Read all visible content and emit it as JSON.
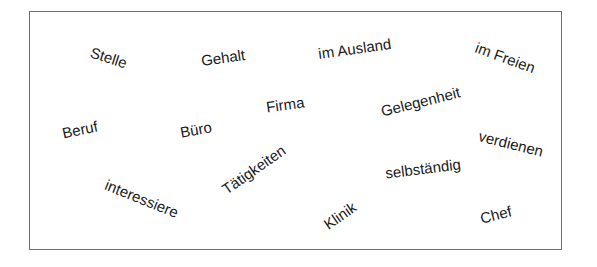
{
  "word_box": {
    "border_color": "#6e6e6e",
    "words": [
      {
        "text": "Stelle",
        "cx": 109,
        "cy": 57,
        "rotate": 18
      },
      {
        "text": "Gehalt",
        "cx": 223,
        "cy": 57,
        "rotate": -8
      },
      {
        "text": "im Ausland",
        "cx": 355,
        "cy": 48,
        "rotate": -8
      },
      {
        "text": "im Freien",
        "cx": 505,
        "cy": 57,
        "rotate": 20
      },
      {
        "text": "Beruf",
        "cx": 80,
        "cy": 129,
        "rotate": -12
      },
      {
        "text": "Büro",
        "cx": 196,
        "cy": 129,
        "rotate": -10
      },
      {
        "text": "Firma",
        "cx": 285,
        "cy": 104,
        "rotate": -8
      },
      {
        "text": "Gelegenheit",
        "cx": 420,
        "cy": 101,
        "rotate": -14
      },
      {
        "text": "verdienen",
        "cx": 511,
        "cy": 143,
        "rotate": 14
      },
      {
        "text": "interessiere",
        "cx": 142,
        "cy": 198,
        "rotate": 22
      },
      {
        "text": "Tätigkeiten",
        "cx": 254,
        "cy": 169,
        "rotate": -35
      },
      {
        "text": "selbständig",
        "cx": 423,
        "cy": 168,
        "rotate": -7
      },
      {
        "text": "Klinik",
        "cx": 340,
        "cy": 215,
        "rotate": -35
      },
      {
        "text": "Chef",
        "cx": 496,
        "cy": 214,
        "rotate": -14
      }
    ]
  }
}
